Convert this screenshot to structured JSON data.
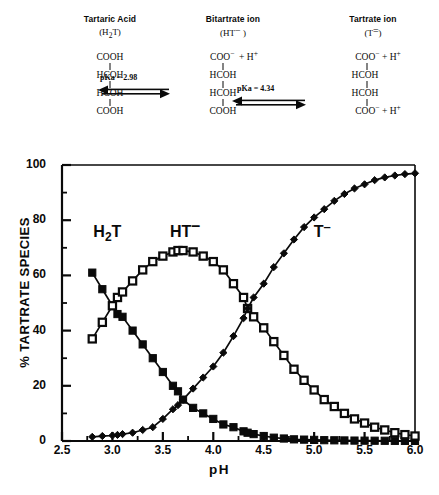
{
  "scheme": {
    "species": [
      {
        "name": "Tartaric Acid",
        "abbr_html": "(H2T)",
        "abbr_main": "H",
        "abbr_sub": "2",
        "abbr_tail": "T",
        "charge": "",
        "lines": [
          "COOH",
          "HCOH",
          "HCOH",
          "COOH"
        ],
        "top_extra": "",
        "bottom_extra": ""
      },
      {
        "name": "Bitartrate ion",
        "abbr_main": "HT",
        "abbr_sub": "",
        "abbr_tail": "",
        "charge": "−",
        "lines": [
          "COO",
          "HCOH",
          "HCOH",
          "COOH"
        ],
        "top_extra": "+ H+",
        "bottom_extra": ""
      },
      {
        "name": "Tartrate ion",
        "abbr_main": "T",
        "abbr_sub": "",
        "abbr_tail": "",
        "charge": "=",
        "lines": [
          "COO",
          "HCOH",
          "HCOH",
          "COO"
        ],
        "top_extra": "+ H+",
        "bottom_extra": "+ H+"
      }
    ],
    "reactions": [
      {
        "label": "pKa = 2.98",
        "value": 2.98
      },
      {
        "label": "pKa = 4.34",
        "value": 4.34
      }
    ]
  },
  "chart_data": {
    "type": "line",
    "title": "",
    "xlabel": "pH",
    "ylabel": "% TARTRATE SPECIES",
    "xlim": [
      2.5,
      6.0
    ],
    "ylim": [
      0,
      100
    ],
    "xticks": [
      "2.5",
      "3.0",
      "3.5",
      "4.0",
      "4.5",
      "5.0",
      "5.5",
      "6.0"
    ],
    "xtick_values": [
      2.5,
      3.0,
      3.5,
      4.0,
      4.5,
      5.0,
      5.5,
      6.0
    ],
    "yticks": [
      "0",
      "20",
      "40",
      "60",
      "80",
      "100"
    ],
    "ytick_values": [
      0,
      20,
      40,
      60,
      80,
      100
    ],
    "grid": false,
    "legend_position": "inline-annotations",
    "x": [
      2.8,
      2.9,
      3.0,
      3.05,
      3.1,
      3.2,
      3.3,
      3.4,
      3.5,
      3.6,
      3.65,
      3.7,
      3.8,
      3.9,
      4.0,
      4.1,
      4.2,
      4.3,
      4.34,
      4.4,
      4.5,
      4.6,
      4.7,
      4.8,
      4.9,
      5.0,
      5.1,
      5.2,
      5.3,
      5.4,
      5.5,
      5.6,
      5.7,
      5.8,
      5.9,
      6.0
    ],
    "series": [
      {
        "name": "H2T",
        "label": "H₂T",
        "marker": "filled-square",
        "values": [
          61,
          55,
          49,
          46,
          45,
          40,
          35,
          30,
          25,
          20,
          18,
          15,
          12,
          10,
          8,
          6,
          5,
          3.5,
          3,
          2.5,
          1.8,
          1.2,
          0.9,
          0.6,
          0.5,
          0.4,
          0.3,
          0.25,
          0.2,
          0.15,
          0.12,
          0.1,
          0.08,
          0.06,
          0.05,
          0.04
        ]
      },
      {
        "name": "HT-",
        "label": "HT⁻",
        "marker": "open-square",
        "values": [
          37,
          43,
          49,
          52,
          54,
          58,
          62,
          65,
          67,
          68.5,
          69,
          69,
          68.5,
          67,
          65,
          62,
          57,
          52,
          48,
          45,
          41,
          36,
          31,
          26,
          22,
          18.5,
          15,
          12.5,
          10,
          8,
          6.5,
          5,
          4,
          3,
          2.3,
          1.8
        ]
      },
      {
        "name": "T=",
        "label": "T⁼",
        "marker": "filled-diamond",
        "values": [
          1.5,
          1.8,
          2,
          2.2,
          2.5,
          3,
          4,
          5,
          8,
          11.5,
          13,
          15,
          19,
          23,
          27,
          32,
          38,
          44.5,
          48,
          52,
          57,
          63,
          68,
          73,
          77.5,
          81,
          84,
          87,
          89.5,
          91.5,
          93,
          94.5,
          95.5,
          96.2,
          96.7,
          97
        ]
      }
    ],
    "annotations": [
      {
        "text": "H₂T",
        "x": 2.95,
        "y": 74
      },
      {
        "text": "HT⁻",
        "x": 3.72,
        "y": 74
      },
      {
        "text": "T⁼",
        "x": 5.08,
        "y": 74
      }
    ]
  }
}
